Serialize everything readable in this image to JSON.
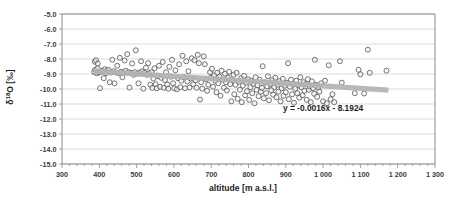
{
  "chart_data": {
    "type": "scatter",
    "title": "",
    "xlabel": "altitude [m a.s.l.]",
    "ylabel": "δ¹⁸O [‰]",
    "xlim": [
      300,
      1300
    ],
    "ylim": [
      -15.0,
      -5.0
    ],
    "grid": true,
    "legend": "none",
    "x_ticks": [
      "300",
      "400",
      "500",
      "600",
      "700",
      "800",
      "900",
      "1 000",
      "1 100",
      "1 200",
      "1 300"
    ],
    "x_tick_values": [
      300,
      400,
      500,
      600,
      700,
      800,
      900,
      1000,
      1100,
      1200,
      1300
    ],
    "y_ticks": [
      "-5.0",
      "-6.0",
      "-7.0",
      "-8.0",
      "-9.0",
      "-10.0",
      "-11.0",
      "-12.0",
      "-13.0",
      "-14.0",
      "-15.0"
    ],
    "y_tick_values": [
      -5,
      -6,
      -7,
      -8,
      -9,
      -10,
      -11,
      -12,
      -13,
      -14,
      -15
    ],
    "annotations": [
      {
        "name": "trendline-equation",
        "text": "y = -0.0016x - 8.1924",
        "x": 1000,
        "y": -11.45
      }
    ],
    "trendline": {
      "equation": "y = -0.0016x - 8.1924",
      "slope": -0.0016,
      "intercept": -8.1924,
      "x_start": 385,
      "x_end": 1175,
      "color": "#b3b3b3"
    },
    "marker_style": {
      "shape": "open-circle",
      "edge_color": "#4a4a4a",
      "fill_color": "#f2f2f2",
      "size": 2.5
    },
    "points": [
      [
        386,
        -8.86
      ],
      [
        388,
        -8.18
      ],
      [
        389,
        -8.72
      ],
      [
        391,
        -8.08
      ],
      [
        393,
        -8.95
      ],
      [
        395,
        -8.62
      ],
      [
        396,
        -8.3
      ],
      [
        399,
        -8.9
      ],
      [
        402,
        -9.95
      ],
      [
        405,
        -8.85
      ],
      [
        408,
        -8.78
      ],
      [
        412,
        -9.28
      ],
      [
        415,
        -8.68
      ],
      [
        418,
        -8.95
      ],
      [
        420,
        -8.8
      ],
      [
        424,
        -8.72
      ],
      [
        428,
        -9.55
      ],
      [
        431,
        -8.9
      ],
      [
        435,
        -8.05
      ],
      [
        438,
        -8.82
      ],
      [
        441,
        -9.62
      ],
      [
        445,
        -8.9
      ],
      [
        448,
        -8.45
      ],
      [
        452,
        -8.95
      ],
      [
        455,
        -7.92
      ],
      [
        458,
        -8.85
      ],
      [
        462,
        -9.22
      ],
      [
        465,
        -8.9
      ],
      [
        468,
        -8.1
      ],
      [
        471,
        -8.78
      ],
      [
        475,
        -7.68
      ],
      [
        478,
        -8.88
      ],
      [
        481,
        -9.9
      ],
      [
        485,
        -8.92
      ],
      [
        488,
        -8.3
      ],
      [
        492,
        -9.05
      ],
      [
        495,
        -8.88
      ],
      [
        498,
        -7.42
      ],
      [
        502,
        -8.98
      ],
      [
        505,
        -9.62
      ],
      [
        508,
        -8.9
      ],
      [
        512,
        -8.15
      ],
      [
        515,
        -8.82
      ],
      [
        518,
        -9.98
      ],
      [
        521,
        -8.92
      ],
      [
        525,
        -8.58
      ],
      [
        528,
        -9.05
      ],
      [
        531,
        -8.28
      ],
      [
        534,
        -8.95
      ],
      [
        537,
        -9.72
      ],
      [
        540,
        -8.88
      ],
      [
        542,
        -9.92
      ],
      [
        545,
        -9.3
      ],
      [
        548,
        -8.62
      ],
      [
        551,
        -9.68
      ],
      [
        554,
        -9.95
      ],
      [
        557,
        -9.15
      ],
      [
        560,
        -8.45
      ],
      [
        563,
        -9.85
      ],
      [
        566,
        -9.25
      ],
      [
        570,
        -8.2
      ],
      [
        573,
        -9.92
      ],
      [
        576,
        -9.4
      ],
      [
        579,
        -8.88
      ],
      [
        582,
        -9.7
      ],
      [
        585,
        -9.98
      ],
      [
        588,
        -8.52
      ],
      [
        592,
        -9.18
      ],
      [
        595,
        -8.05
      ],
      [
        598,
        -9.62
      ],
      [
        601,
        -9.95
      ],
      [
        604,
        -8.75
      ],
      [
        608,
        -10.02
      ],
      [
        611,
        -9.28
      ],
      [
        614,
        -8.35
      ],
      [
        617,
        -9.88
      ],
      [
        620,
        -9.45
      ],
      [
        623,
        -7.78
      ],
      [
        627,
        -9.22
      ],
      [
        630,
        -9.95
      ],
      [
        633,
        -8.15
      ],
      [
        636,
        -9.5
      ],
      [
        639,
        -8.82
      ],
      [
        642,
        -9.9
      ],
      [
        645,
        -9.3
      ],
      [
        648,
        -7.95
      ],
      [
        652,
        -9.68
      ],
      [
        655,
        -8.08
      ],
      [
        658,
        -9.42
      ],
      [
        661,
        -9.92
      ],
      [
        664,
        -7.72
      ],
      [
        667,
        -8.28
      ],
      [
        670,
        -10.7
      ],
      [
        673,
        -9.55
      ],
      [
        676,
        -9.98
      ],
      [
        680,
        -7.82
      ],
      [
        683,
        -8.35
      ],
      [
        686,
        -9.35
      ],
      [
        689,
        -10.12
      ],
      [
        692,
        -9.72
      ],
      [
        697,
        -8.88
      ],
      [
        700,
        -9.25
      ],
      [
        702,
        -8.65
      ],
      [
        705,
        -9.85
      ],
      [
        708,
        -9.08
      ],
      [
        711,
        -9.45
      ],
      [
        714,
        -10.22
      ],
      [
        716,
        -8.92
      ],
      [
        719,
        -9.62
      ],
      [
        722,
        -9.18
      ],
      [
        725,
        -10.45
      ],
      [
        728,
        -8.78
      ],
      [
        731,
        -9.38
      ],
      [
        734,
        -9.92
      ],
      [
        737,
        -8.98
      ],
      [
        740,
        -9.55
      ],
      [
        742,
        -10.1
      ],
      [
        745,
        -9.25
      ],
      [
        748,
        -8.85
      ],
      [
        751,
        -9.68
      ],
      [
        754,
        -10.82
      ],
      [
        757,
        -9.42
      ],
      [
        760,
        -9.05
      ],
      [
        762,
        -10.35
      ],
      [
        765,
        -9.72
      ],
      [
        768,
        -8.92
      ],
      [
        771,
        -10.65
      ],
      [
        774,
        -9.52
      ],
      [
        777,
        -10.05
      ],
      [
        780,
        -9.28
      ],
      [
        782,
        -10.88
      ],
      [
        785,
        -9.78
      ],
      [
        788,
        -9.12
      ],
      [
        791,
        -10.42
      ],
      [
        794,
        -9.58
      ],
      [
        796,
        -10.15
      ],
      [
        799,
        -9.35
      ],
      [
        802,
        -10.72
      ],
      [
        805,
        -9.88
      ],
      [
        808,
        -9.45
      ],
      [
        810,
        -10.28
      ],
      [
        813,
        -9.65
      ],
      [
        816,
        -10.95
      ],
      [
        819,
        -9.22
      ],
      [
        822,
        -10.05
      ],
      [
        824,
        -9.75
      ],
      [
        827,
        -10.48
      ],
      [
        830,
        -9.38
      ],
      [
        833,
        -10.18
      ],
      [
        836,
        -9.92
      ],
      [
        838,
        -8.48
      ],
      [
        841,
        -10.62
      ],
      [
        844,
        -9.55
      ],
      [
        847,
        -10.28
      ],
      [
        850,
        -9.82
      ],
      [
        852,
        -9.15
      ],
      [
        855,
        -10.75
      ],
      [
        858,
        -9.68
      ],
      [
        861,
        -10.08
      ],
      [
        864,
        -9.42
      ],
      [
        866,
        -10.38
      ],
      [
        869,
        -9.88
      ],
      [
        872,
        -9.25
      ],
      [
        875,
        -10.55
      ],
      [
        878,
        -9.72
      ],
      [
        880,
        -10.18
      ],
      [
        883,
        -9.48
      ],
      [
        886,
        -10.82
      ],
      [
        889,
        -9.95
      ],
      [
        892,
        -9.32
      ],
      [
        894,
        -10.45
      ],
      [
        897,
        -9.78
      ],
      [
        900,
        -10.22
      ],
      [
        903,
        -9.58
      ],
      [
        906,
        -8.28
      ],
      [
        908,
        -10.68
      ],
      [
        911,
        -9.85
      ],
      [
        914,
        -9.38
      ],
      [
        917,
        -10.35
      ],
      [
        920,
        -9.65
      ],
      [
        922,
        -10.92
      ],
      [
        925,
        -9.98
      ],
      [
        928,
        -9.45
      ],
      [
        931,
        -10.28
      ],
      [
        934,
        -9.75
      ],
      [
        936,
        -10.58
      ],
      [
        939,
        -9.22
      ],
      [
        942,
        -9.88
      ],
      [
        945,
        -10.42
      ],
      [
        948,
        -9.55
      ],
      [
        950,
        -10.12
      ],
      [
        953,
        -9.68
      ],
      [
        956,
        -10.72
      ],
      [
        959,
        -9.35
      ],
      [
        962,
        -10.05
      ],
      [
        964,
        -9.82
      ],
      [
        967,
        -10.88
      ],
      [
        970,
        -9.48
      ],
      [
        973,
        -9.95
      ],
      [
        976,
        -10.32
      ],
      [
        978,
        -8.05
      ],
      [
        981,
        -9.72
      ],
      [
        984,
        -10.52
      ],
      [
        987,
        -9.88
      ],
      [
        990,
        -10.18
      ],
      [
        995,
        -9.62
      ],
      [
        1000,
        -10.82
      ],
      [
        1005,
        -9.45
      ],
      [
        1010,
        -10.95
      ],
      [
        1015,
        -8.42
      ],
      [
        1020,
        -10.68
      ],
      [
        1025,
        -10.35
      ],
      [
        1030,
        -10.88
      ],
      [
        1045,
        -8.15
      ],
      [
        1050,
        -9.58
      ],
      [
        1085,
        -10.28
      ],
      [
        1095,
        -8.72
      ],
      [
        1100,
        -9.02
      ],
      [
        1110,
        -10.3
      ],
      [
        1120,
        -7.38
      ],
      [
        1125,
        -8.92
      ],
      [
        1170,
        -8.78
      ]
    ]
  },
  "axis": {
    "x_title": "altitude [m a.s.l.]",
    "y_title": "δ¹⁸O [‰]",
    "y_title_base": "δ",
    "y_title_sup": "18",
    "y_title_rest": "O [‰]"
  }
}
